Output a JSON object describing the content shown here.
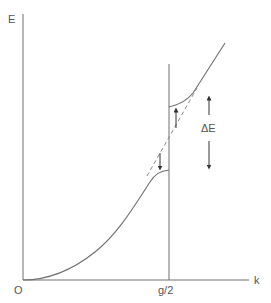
{
  "diagram": {
    "axes": {
      "y_label": "E",
      "x_label": "k",
      "origin_label": "O",
      "boundary_label": "g/2"
    },
    "annotations": {
      "gap_label": "ΔE"
    },
    "colors": {
      "line": "#6e6e6e",
      "text": "#555555",
      "background": "#ffffff"
    }
  }
}
